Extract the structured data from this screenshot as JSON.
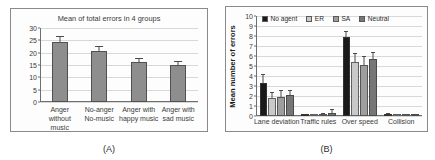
{
  "figure": {
    "panels": [
      {
        "label": "(A)",
        "chart_data": {
          "type": "bar",
          "title": "Mean of total errors in 4 groups",
          "xlabel": "",
          "ylabel": "",
          "ylim": [
            0,
            30
          ],
          "yticks": [
            0,
            5,
            10,
            15,
            20,
            25,
            30
          ],
          "grid": true,
          "legend": false,
          "legend_position": "none",
          "categories": [
            "Anger without music",
            "No-anger No-music",
            "Anger with happy music",
            "Anger with sad music"
          ],
          "category_lines": [
            [
              "Anger",
              "without",
              "music"
            ],
            [
              "No-anger",
              "No-music"
            ],
            [
              "Anger with",
              "happy music"
            ],
            [
              "Anger with",
              "sad music"
            ]
          ],
          "values": [
            24.5,
            20.8,
            16.3,
            15.2
          ],
          "errors": [
            2.0,
            1.6,
            1.1,
            1.0
          ],
          "bar_color": "#8e8e8e"
        }
      },
      {
        "label": "(B)",
        "chart_data": {
          "type": "bar",
          "title": "",
          "xlabel": "",
          "ylabel": "Mean number of errors",
          "ylim": [
            0,
            10
          ],
          "yticks": [
            0,
            1,
            2,
            3,
            4,
            5,
            6,
            7,
            8,
            9,
            10
          ],
          "grid": true,
          "legend": true,
          "legend_position": "top",
          "categories": [
            "Lane deviation",
            "Traffic rules",
            "Over speed",
            "Collision"
          ],
          "series": [
            {
              "name": "No agent",
              "color": "#1a1a1a",
              "values": [
                3.3,
                0.05,
                7.9,
                0.12
              ],
              "errors": [
                0.85,
                0.05,
                0.55,
                0.1
              ]
            },
            {
              "name": "ER",
              "color": "#c9c9c9",
              "values": [
                1.8,
                0.08,
                5.4,
                0.05
              ],
              "errors": [
                0.55,
                0.06,
                0.85,
                0.05
              ]
            },
            {
              "name": "SA",
              "color": "#9e9e9e",
              "values": [
                1.9,
                0.1,
                5.1,
                0.03
              ],
              "errors": [
                0.6,
                0.08,
                0.8,
                0.04
              ]
            },
            {
              "name": "Neutral",
              "color": "#767676",
              "values": [
                2.1,
                0.35,
                5.7,
                0.04
              ],
              "errors": [
                0.45,
                0.22,
                0.65,
                0.04
              ]
            }
          ]
        }
      }
    ]
  }
}
